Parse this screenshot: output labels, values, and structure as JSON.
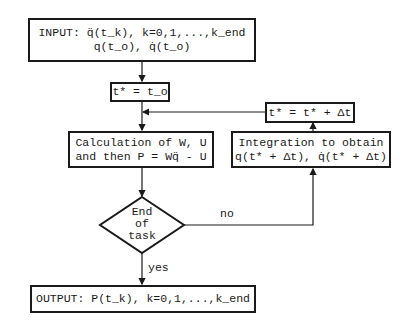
{
  "flowchart": {
    "input_box": {
      "line1": "INPUT: q̈(t_k), k=0,1,...,k_end",
      "line2": "q(t_o), q̇(t_o)"
    },
    "init_box": {
      "text": "t* = t_o"
    },
    "calc_box": {
      "line1": "Calculation of W, U",
      "line2": "and then P = Wq̈ - U"
    },
    "decision": {
      "line1": "End",
      "line2": "of",
      "line3": "task"
    },
    "yes_label": "yes",
    "no_label": "no",
    "integration_box": {
      "line1": "Integration to obtain",
      "line2": "q(t* + Δt), q̇(t* + Δt)"
    },
    "update_box": {
      "text": "t* = t* + Δt"
    },
    "output_box": {
      "text": "OUTPUT: P(t_k), k=0,1,...,k_end"
    }
  }
}
